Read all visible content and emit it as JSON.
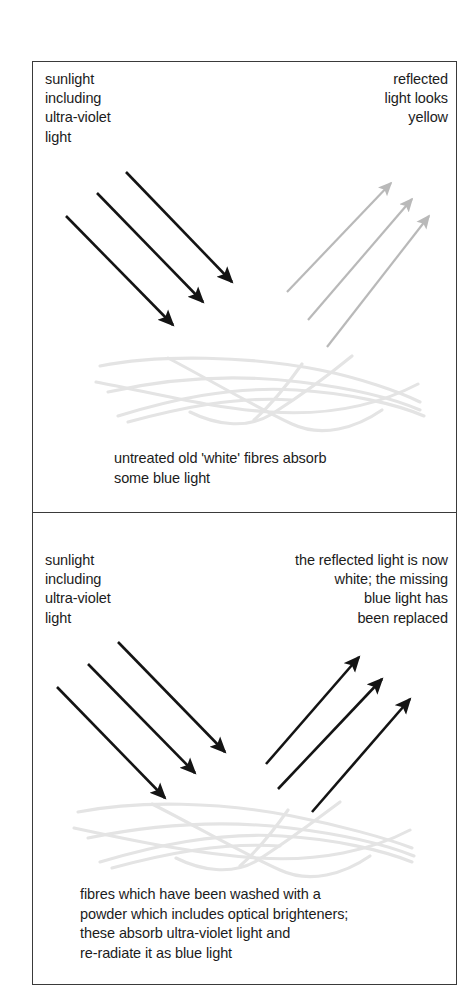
{
  "figure": {
    "border_color": "#3a3a3a",
    "background_color": "#ffffff"
  },
  "colors": {
    "incident_arrow": "#141414",
    "reflected_yellow_arrow": "#b9b9b9",
    "reflected_white_arrow": "#141414",
    "fibre": "#e4e4e4",
    "text": "#1c1c1c"
  },
  "panels": [
    {
      "id": "untreated-fibres",
      "labels": {
        "incident": "sunlight\nincluding\nultra-violet\nlight",
        "reflected": "reflected\nlight looks\nyellow"
      },
      "caption": "untreated old 'white' fibres absorb\nsome blue light",
      "incident_arrows": [
        {
          "x1": 126,
          "y1": 172,
          "x2": 237,
          "y2": 287
        },
        {
          "x1": 97,
          "y1": 193,
          "x2": 208,
          "y2": 307
        },
        {
          "x1": 66,
          "y1": 216,
          "x2": 178,
          "y2": 330
        }
      ],
      "reflected_arrows": [
        {
          "x1": 287,
          "y1": 292,
          "x2": 396,
          "y2": 178
        },
        {
          "x1": 308,
          "y1": 320,
          "x2": 417,
          "y2": 194
        },
        {
          "x1": 327,
          "y1": 347,
          "x2": 434,
          "y2": 211
        }
      ],
      "fibre_band": {
        "top": 352,
        "height": 85
      }
    },
    {
      "id": "brightened-fibres",
      "labels": {
        "incident": "sunlight\nincluding\nultra-violet\nlight",
        "reflected": "the reflected light is now\nwhite; the missing\nblue light has\nbeen replaced"
      },
      "caption": "fibres which have been washed with a\npowder which includes optical brighteners;\nthese absorb ultra-violet light and\nre-radiate it as blue light",
      "incident_arrows": [
        {
          "x1": 118,
          "y1": 642,
          "x2": 230,
          "y2": 757
        },
        {
          "x1": 88,
          "y1": 664,
          "x2": 200,
          "y2": 778
        },
        {
          "x1": 57,
          "y1": 687,
          "x2": 170,
          "y2": 803
        }
      ],
      "reflected_arrows": [
        {
          "x1": 266,
          "y1": 764,
          "x2": 364,
          "y2": 652
        },
        {
          "x1": 278,
          "y1": 789,
          "x2": 387,
          "y2": 674
        },
        {
          "x1": 312,
          "y1": 812,
          "x2": 415,
          "y2": 694
        }
      ],
      "fibre_band": {
        "top": 800,
        "height": 80
      }
    }
  ]
}
